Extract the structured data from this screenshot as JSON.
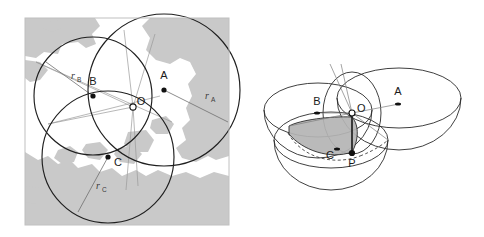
{
  "figure": {
    "caption": "",
    "background_color": "#ffffff",
    "panels": [
      {
        "id": "left",
        "name": "2d-trilateration-map",
        "description": "Two-dimensional trilateration on a coastline map: three circles of radii rA, rB, rC centred at stations A, B and C intersect at the common point O.",
        "map": {
          "sea_color": "#ffffff",
          "land_color": "#c9c9c9",
          "frame_color": "#c9c9c9"
        },
        "stations": [
          {
            "key": "A",
            "label": "A",
            "cx": 164,
            "cy": 90,
            "radius": 76,
            "radius_label": "r",
            "radius_subscript": "A",
            "radius_label_x": 207,
            "radius_label_y": 98
          },
          {
            "key": "B",
            "label": "B",
            "cx": 93,
            "cy": 96,
            "radius": 59,
            "radius_label": "r",
            "radius_subscript": "B",
            "radius_label_x": 74,
            "radius_label_y": 78
          },
          {
            "key": "C",
            "label": "C",
            "cx": 108,
            "cy": 157,
            "radius": 66,
            "radius_label": "r",
            "radius_subscript": "C",
            "radius_label_x": 99,
            "radius_label_y": 188
          }
        ],
        "intersection": {
          "key": "O",
          "label": "O",
          "cx": 133,
          "cy": 107,
          "marker": "open-circle"
        }
      },
      {
        "id": "right",
        "name": "3d-trilateration-spheres",
        "description": "Three-dimensional view: three spheres around stations A, B and C intersect; the shaded lens-shaped surface marks the common intersection, with O on the surface above the true position P.",
        "shade_color": "#b4b4b4",
        "stations": [
          {
            "key": "A",
            "label": "A",
            "x": 398,
            "y": 104
          },
          {
            "key": "B",
            "label": "B",
            "x": 317,
            "y": 113
          },
          {
            "key": "C",
            "label": "C",
            "x": 337,
            "y": 150
          }
        ],
        "points": [
          {
            "key": "O",
            "label": "O",
            "x": 351,
            "y": 113,
            "marker": "open-circle"
          },
          {
            "key": "P",
            "label": "P",
            "x": 352,
            "y": 153,
            "marker": "filled-dot"
          }
        ]
      }
    ]
  }
}
